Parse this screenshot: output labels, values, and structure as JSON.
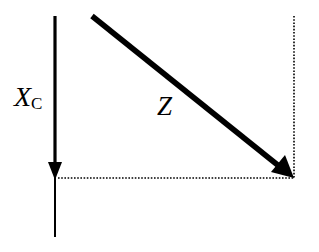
{
  "diagram": {
    "type": "phasor-diagram",
    "labels": {
      "xc_main": "X",
      "xc_sub": "C",
      "z": "Z"
    },
    "elements": [
      {
        "name": "xc-vector",
        "kind": "arrow",
        "from": [
          55,
          16
        ],
        "to": [
          55,
          178
        ],
        "style": "solid-thick",
        "description": "Vertical downward arrow labeled X_C"
      },
      {
        "name": "axis-extension",
        "kind": "line",
        "from": [
          55,
          178
        ],
        "to": [
          55,
          237
        ],
        "style": "solid-thin"
      },
      {
        "name": "z-vector",
        "kind": "arrow",
        "from": [
          92,
          16
        ],
        "to": [
          294,
          178
        ],
        "style": "solid-thick",
        "description": "Diagonal arrow labeled Z"
      },
      {
        "name": "horizontal-projection",
        "kind": "line",
        "from": [
          57,
          178
        ],
        "to": [
          294,
          178
        ],
        "style": "dotted"
      },
      {
        "name": "vertical-projection",
        "kind": "line",
        "from": [
          294,
          16
        ],
        "to": [
          294,
          178
        ],
        "style": "dotted"
      }
    ],
    "colors": {
      "stroke": "#000000",
      "background": "#ffffff"
    }
  }
}
